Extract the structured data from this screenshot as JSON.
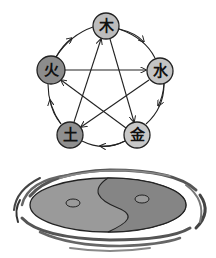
{
  "diagram": {
    "elements": [
      {
        "id": "wood",
        "label": "木",
        "cx": 106,
        "cy": 26,
        "r": 13,
        "fill": "#bdbdbd"
      },
      {
        "id": "fire",
        "label": "火",
        "cx": 51,
        "cy": 70,
        "r": 14,
        "fill": "#8c8c8c"
      },
      {
        "id": "water",
        "label": "水",
        "cx": 160,
        "cy": 71,
        "r": 13,
        "fill": "#c4c4c4"
      },
      {
        "id": "earth",
        "label": "土",
        "cx": 70,
        "cy": 135,
        "r": 13,
        "fill": "#8f8f8f"
      },
      {
        "id": "metal",
        "label": "金",
        "cx": 137,
        "cy": 135,
        "r": 13,
        "fill": "#c8c8c8"
      }
    ],
    "generating_cycle": [
      "wood→water",
      "water→metal",
      "metal→earth",
      "earth→fire",
      "fire→wood"
    ],
    "overcoming_cycle": [
      "fire→water",
      "water→earth",
      "earth→wood",
      "wood→metal",
      "metal→fire"
    ],
    "yin_yang": {
      "light": "#9a9a9a",
      "dark": "#808080",
      "outline": "#222222"
    },
    "colors": {
      "stroke": "#222222",
      "background": "#ffffff"
    }
  }
}
